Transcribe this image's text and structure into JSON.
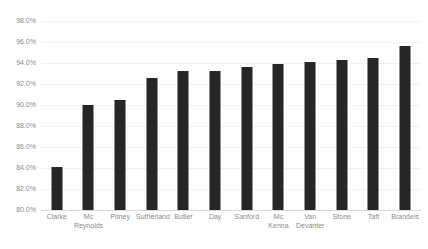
{
  "chart_data": {
    "type": "bar",
    "title": "",
    "subtitle": "",
    "xlabel": "",
    "ylabel": "",
    "categories": [
      "Clarke",
      "Mc\nReynolds",
      "Pitney",
      "Sutherland",
      "Butler",
      "Day",
      "Sanford",
      "Mc\nKenna",
      "Van\nDevanter",
      "Stone",
      "Taft",
      "Brandeis"
    ],
    "values": [
      84.1,
      90.0,
      90.5,
      92.6,
      93.2,
      93.2,
      93.6,
      93.9,
      94.1,
      94.3,
      94.5,
      95.6
    ],
    "value_labels": [
      "84.1%",
      "90.0%",
      "90.5%",
      "92.6%",
      "93.2%",
      "93.2%",
      "93.6%",
      "93.9%",
      "94.1%",
      "94.3%",
      "94.5%",
      "95.6%"
    ],
    "ylim": [
      80.0,
      98.0
    ],
    "ytick_values": [
      98.0,
      96.0,
      94.0,
      92.0,
      90.0,
      88.0,
      86.0,
      84.0,
      82.0,
      80.0
    ],
    "ytick_labels": [
      "98.0%",
      "96.0%",
      "94.0%",
      "92.0%",
      "90.0%",
      "88.0%",
      "86.0%",
      "84.0%",
      "82.0%",
      "80.0%"
    ],
    "grid": true,
    "grid_axis": "y",
    "legend": false,
    "legend_position": "none",
    "colors": {
      "bar": "#262626",
      "gridline": "#f2f2f2",
      "axis_line": "#d9d9d9",
      "tick_label": "#8c8c8c",
      "background": "#ffffff"
    }
  }
}
